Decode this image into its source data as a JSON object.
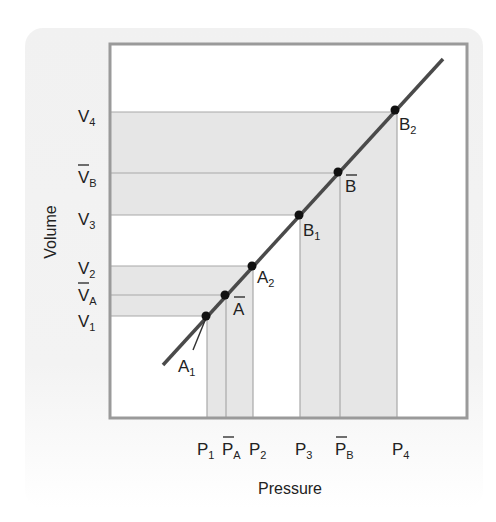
{
  "diagram": {
    "x_axis_title": "Pressure",
    "y_axis_title": "Volume",
    "colors": {
      "panel_background": "#f1f1f1",
      "plot_background": "#ffffff",
      "plot_border": "#9a9a9a",
      "shaded_band": "#e4e4e4",
      "guide_line": "#a8a8a8",
      "curve": "#4a4a4a",
      "point": "#111111",
      "text": "#222222"
    },
    "y_labels": [
      {
        "base": "V",
        "sub": "4",
        "bar": false
      },
      {
        "base": "V",
        "sub": "B",
        "bar": true
      },
      {
        "base": "V",
        "sub": "3",
        "bar": false
      },
      {
        "base": "V",
        "sub": "2",
        "bar": false
      },
      {
        "base": "V",
        "sub": "A",
        "bar": true
      },
      {
        "base": "V",
        "sub": "1",
        "bar": false
      }
    ],
    "x_labels": [
      {
        "base": "P",
        "sub": "1",
        "bar": false
      },
      {
        "base": "P",
        "sub": "A",
        "bar": true
      },
      {
        "base": "P",
        "sub": "2",
        "bar": false
      },
      {
        "base": "P",
        "sub": "3",
        "bar": false
      },
      {
        "base": "P",
        "sub": "B",
        "bar": true
      },
      {
        "base": "P",
        "sub": "4",
        "bar": false
      }
    ],
    "points": [
      {
        "base": "A",
        "sub": "1",
        "bar": false
      },
      {
        "base": "A",
        "sub": "",
        "bar": true
      },
      {
        "base": "A",
        "sub": "2",
        "bar": false
      },
      {
        "base": "B",
        "sub": "1",
        "bar": false
      },
      {
        "base": "B",
        "sub": "",
        "bar": true
      },
      {
        "base": "B",
        "sub": "2",
        "bar": false
      }
    ]
  }
}
